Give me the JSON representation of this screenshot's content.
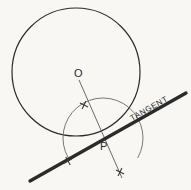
{
  "figure": {
    "background_color": "#f8f7f3",
    "ink_color": "#2b2b2b",
    "construction_color": "#5a5a5a",
    "labels": {
      "center": "O",
      "point": "P",
      "tangent": "TANGENT"
    },
    "geometry": {
      "circle": {
        "cx": 76,
        "cy": 72,
        "r": 64
      },
      "center_marker": {
        "x": 76,
        "y": 72
      },
      "tangency_point": {
        "x": 103,
        "y": 138
      },
      "radius_line": {
        "x1": 79,
        "y1": 80,
        "x2": 122,
        "y2": 178
      },
      "tangent_line": {
        "x1": 30,
        "y1": 181,
        "x2": 186,
        "y2": 93
      },
      "construction_arc": {
        "cx": 103,
        "cy": 138,
        "r": 40,
        "start_angle_deg": 150,
        "end_angle_deg": 390
      },
      "tick_marks": [
        {
          "x": 84,
          "y": 105,
          "angle_deg": 25,
          "length": 9
        },
        {
          "x": 68,
          "y": 161,
          "angle_deg": 60,
          "length": 9
        },
        {
          "x": 120,
          "y": 172,
          "angle_deg": 25,
          "length": 9
        }
      ]
    },
    "label_positions": {
      "center": {
        "x": 74,
        "y": 77,
        "size": 11
      },
      "point": {
        "x": 100,
        "y": 150,
        "size": 11
      },
      "tangent": {
        "x": 132,
        "y": 121,
        "size": 8,
        "rotation_deg": -29.5,
        "letter_spacing": 0.6
      }
    }
  }
}
